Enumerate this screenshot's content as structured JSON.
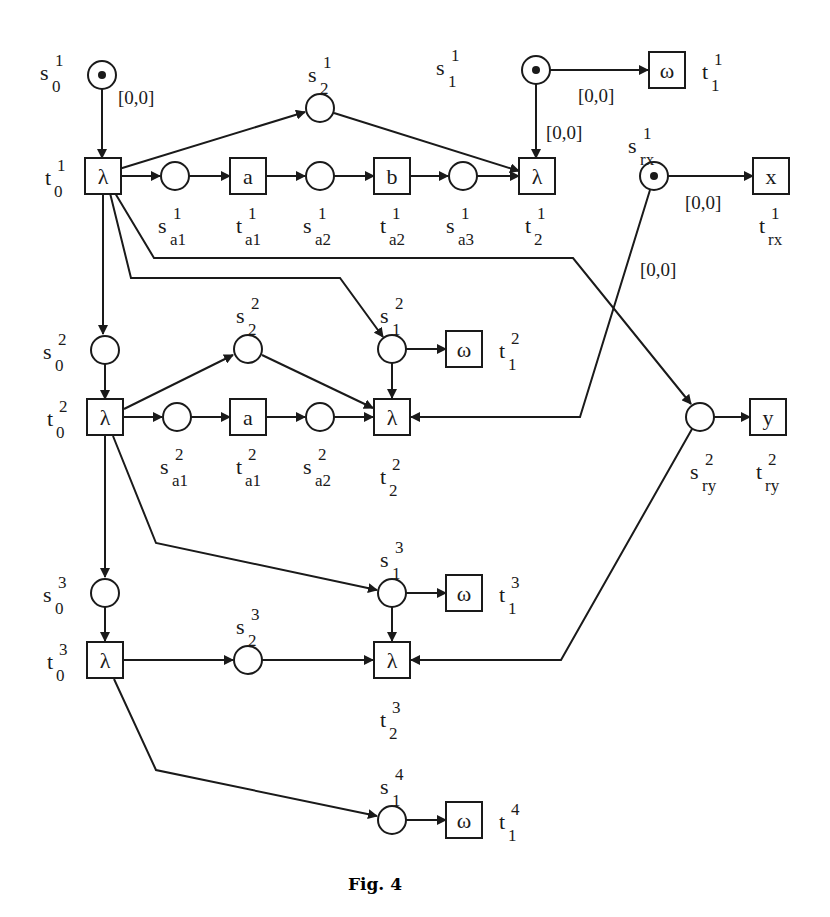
{
  "figure": {
    "caption": "Fig. 4",
    "type": "petri-net",
    "stroke_color": "#1a1a1a",
    "background": "#ffffff"
  },
  "places": [
    {
      "id": "s0_1",
      "base": "s",
      "sub": "0",
      "sup": "1",
      "x": 102,
      "y": 75,
      "token": true
    },
    {
      "id": "s2_1",
      "base": "s",
      "sub": "2",
      "sup": "1",
      "x": 320,
      "y": 108,
      "token": false
    },
    {
      "id": "sa1_1",
      "base": "s",
      "sub": "a1",
      "sup": "1",
      "x": 175,
      "y": 176,
      "token": false
    },
    {
      "id": "sa2_1",
      "base": "s",
      "sub": "a2",
      "sup": "1",
      "x": 320,
      "y": 176,
      "token": false
    },
    {
      "id": "sa3_1",
      "base": "s",
      "sub": "a3",
      "sup": "1",
      "x": 463,
      "y": 176,
      "token": false
    },
    {
      "id": "s1_1",
      "base": "s",
      "sub": "1",
      "sup": "1",
      "x": 536,
      "y": 70,
      "token": true
    },
    {
      "id": "srx_1",
      "base": "s",
      "sub": "rx",
      "sup": "1",
      "x": 654,
      "y": 176,
      "token": true
    },
    {
      "id": "s0_2",
      "base": "s",
      "sub": "0",
      "sup": "2",
      "x": 105,
      "y": 350,
      "token": false
    },
    {
      "id": "s2_2",
      "base": "s",
      "sub": "2",
      "sup": "2",
      "x": 248,
      "y": 349,
      "token": false
    },
    {
      "id": "s1_2",
      "base": "s",
      "sub": "1",
      "sup": "2",
      "x": 392,
      "y": 349,
      "token": false
    },
    {
      "id": "sa1_2",
      "base": "s",
      "sub": "a1",
      "sup": "2",
      "x": 177,
      "y": 417,
      "token": false
    },
    {
      "id": "sa2_2",
      "base": "s",
      "sub": "a2",
      "sup": "2",
      "x": 320,
      "y": 417,
      "token": false
    },
    {
      "id": "sry_2",
      "base": "s",
      "sub": "ry",
      "sup": "2",
      "x": 700,
      "y": 417,
      "token": false
    },
    {
      "id": "s0_3",
      "base": "s",
      "sub": "0",
      "sup": "3",
      "x": 105,
      "y": 593,
      "token": false
    },
    {
      "id": "s1_3",
      "base": "s",
      "sub": "1",
      "sup": "3",
      "x": 392,
      "y": 593,
      "token": false
    },
    {
      "id": "s2_3",
      "base": "s",
      "sub": "2",
      "sup": "3",
      "x": 248,
      "y": 660,
      "token": false
    },
    {
      "id": "s1_4",
      "base": "s",
      "sub": "1",
      "sup": "4",
      "x": 392,
      "y": 820,
      "token": false
    }
  ],
  "transitions": [
    {
      "id": "t0_1",
      "symbol": "λ",
      "base": "t",
      "sub": "0",
      "sup": "1",
      "x": 103,
      "y": 176
    },
    {
      "id": "ta1_1",
      "symbol": "a",
      "base": "t",
      "sub": "a1",
      "sup": "1",
      "x": 248,
      "y": 176
    },
    {
      "id": "ta2_1",
      "symbol": "b",
      "base": "t",
      "sub": "a2",
      "sup": "1",
      "x": 392,
      "y": 176
    },
    {
      "id": "t2_1",
      "symbol": "λ",
      "base": "t",
      "sub": "2",
      "sup": "1",
      "x": 537,
      "y": 176
    },
    {
      "id": "t1_1",
      "symbol": "ω",
      "base": "t",
      "sub": "1",
      "sup": "1",
      "x": 667,
      "y": 70
    },
    {
      "id": "trx_1",
      "symbol": "x",
      "base": "t",
      "sub": "rx",
      "sup": "1",
      "x": 771,
      "y": 176
    },
    {
      "id": "t0_2",
      "symbol": "λ",
      "base": "t",
      "sub": "0",
      "sup": "2",
      "x": 105,
      "y": 417
    },
    {
      "id": "ta1_2",
      "symbol": "a",
      "base": "t",
      "sub": "a1",
      "sup": "2",
      "x": 248,
      "y": 417
    },
    {
      "id": "t2_2",
      "symbol": "λ",
      "base": "t",
      "sub": "2",
      "sup": "2",
      "x": 392,
      "y": 417
    },
    {
      "id": "t1_2",
      "symbol": "ω",
      "base": "t",
      "sub": "1",
      "sup": "2",
      "x": 464,
      "y": 349
    },
    {
      "id": "try_2",
      "symbol": "y",
      "base": "t",
      "sub": "ry",
      "sup": "2",
      "x": 768,
      "y": 417
    },
    {
      "id": "t0_3",
      "symbol": "λ",
      "base": "t",
      "sub": "0",
      "sup": "3",
      "x": 105,
      "y": 660
    },
    {
      "id": "t2_3",
      "symbol": "λ",
      "base": "t",
      "sub": "2",
      "sup": "3",
      "x": 392,
      "y": 660
    },
    {
      "id": "t1_3",
      "symbol": "ω",
      "base": "t",
      "sub": "1",
      "sup": "3",
      "x": 464,
      "y": 593
    },
    {
      "id": "t1_4",
      "symbol": "ω",
      "base": "t",
      "sub": "1",
      "sup": "4",
      "x": 464,
      "y": 820
    }
  ],
  "intervals": [
    {
      "id": "iv_s0_1",
      "text": "[0,0]",
      "x": 118,
      "y": 104
    },
    {
      "id": "iv_s1_1_t1_1",
      "text": "[0,0]",
      "x": 578,
      "y": 102
    },
    {
      "id": "iv_s1_1_t2_1",
      "text": "[0,0]",
      "x": 546,
      "y": 139
    },
    {
      "id": "iv_srx_trx",
      "text": "[0,0]",
      "x": 685,
      "y": 209
    },
    {
      "id": "iv_srx_t2_2",
      "text": "[0,0]",
      "x": 640,
      "y": 276
    }
  ],
  "arcs": [
    {
      "from": "s0_1",
      "to": "t0_1",
      "points": [
        [
          102,
          89
        ],
        [
          102,
          158
        ]
      ]
    },
    {
      "from": "t0_1",
      "to": "s2_1",
      "points": [
        [
          119,
          169
        ],
        [
          305,
          112
        ]
      ]
    },
    {
      "from": "s2_1",
      "to": "t2_1",
      "points": [
        [
          334,
          113
        ],
        [
          519,
          171
        ]
      ]
    },
    {
      "from": "t0_1",
      "to": "sa1_1",
      "points": [
        [
          119,
          176
        ],
        [
          160,
          176
        ]
      ]
    },
    {
      "from": "sa1_1",
      "to": "ta1_1",
      "points": [
        [
          189,
          176
        ],
        [
          230,
          176
        ]
      ]
    },
    {
      "from": "ta1_1",
      "to": "sa2_1",
      "points": [
        [
          266,
          176
        ],
        [
          305,
          176
        ]
      ]
    },
    {
      "from": "sa2_1",
      "to": "ta2_1",
      "points": [
        [
          334,
          176
        ],
        [
          374,
          176
        ]
      ]
    },
    {
      "from": "ta2_1",
      "to": "sa3_1",
      "points": [
        [
          410,
          176
        ],
        [
          448,
          176
        ]
      ]
    },
    {
      "from": "sa3_1",
      "to": "t2_1",
      "points": [
        [
          477,
          176
        ],
        [
          519,
          176
        ]
      ]
    },
    {
      "from": "s1_1",
      "to": "t1_1",
      "points": [
        [
          550,
          70
        ],
        [
          648,
          70
        ]
      ]
    },
    {
      "from": "s1_1",
      "to": "t2_1",
      "points": [
        [
          536,
          84
        ],
        [
          536,
          158
        ]
      ]
    },
    {
      "from": "srx_1",
      "to": "trx_1",
      "points": [
        [
          668,
          176
        ],
        [
          753,
          176
        ]
      ]
    },
    {
      "from": "t0_1",
      "to": "sry_2",
      "points": [
        [
          115,
          193
        ],
        [
          154,
          258
        ],
        [
          573,
          258
        ],
        [
          691,
          404
        ]
      ]
    },
    {
      "from": "t0_1",
      "to": "s1_2",
      "points": [
        [
          110,
          193
        ],
        [
          131,
          278
        ],
        [
          340,
          278
        ],
        [
          383,
          337
        ]
      ]
    },
    {
      "from": "t0_1",
      "to": "s0_2",
      "points": [
        [
          103,
          193
        ],
        [
          103,
          334
        ]
      ]
    },
    {
      "from": "s0_2",
      "to": "t0_2",
      "points": [
        [
          105,
          364
        ],
        [
          105,
          399
        ]
      ]
    },
    {
      "from": "t0_2",
      "to": "s2_2",
      "points": [
        [
          124,
          409
        ],
        [
          233,
          355
        ]
      ]
    },
    {
      "from": "s2_2",
      "to": "t2_2",
      "points": [
        [
          262,
          355
        ],
        [
          373,
          408
        ]
      ]
    },
    {
      "from": "t0_2",
      "to": "sa1_2",
      "points": [
        [
          124,
          417
        ],
        [
          162,
          417
        ]
      ]
    },
    {
      "from": "sa1_2",
      "to": "ta1_2",
      "points": [
        [
          191,
          417
        ],
        [
          230,
          417
        ]
      ]
    },
    {
      "from": "ta1_2",
      "to": "sa2_2",
      "points": [
        [
          266,
          417
        ],
        [
          305,
          417
        ]
      ]
    },
    {
      "from": "sa2_2",
      "to": "t2_2",
      "points": [
        [
          334,
          417
        ],
        [
          373,
          417
        ]
      ]
    },
    {
      "from": "s1_2",
      "to": "t1_2",
      "points": [
        [
          406,
          349
        ],
        [
          446,
          349
        ]
      ]
    },
    {
      "from": "s1_2",
      "to": "t2_2",
      "points": [
        [
          392,
          363
        ],
        [
          392,
          398
        ]
      ]
    },
    {
      "from": "srx_1",
      "to": "t2_2",
      "points": [
        [
          650,
          190
        ],
        [
          580,
          417
        ],
        [
          411,
          417
        ]
      ]
    },
    {
      "from": "sry_2",
      "to": "try_2",
      "points": [
        [
          714,
          417
        ],
        [
          750,
          417
        ]
      ]
    },
    {
      "from": "t0_2",
      "to": "s0_3",
      "points": [
        [
          105,
          436
        ],
        [
          105,
          577
        ]
      ]
    },
    {
      "from": "t0_2",
      "to": "s1_3",
      "points": [
        [
          113,
          436
        ],
        [
          156,
          543
        ],
        [
          377,
          590
        ]
      ]
    },
    {
      "from": "s0_3",
      "to": "t0_3",
      "points": [
        [
          105,
          607
        ],
        [
          105,
          641
        ]
      ]
    },
    {
      "from": "t0_3",
      "to": "s2_3",
      "points": [
        [
          124,
          660
        ],
        [
          233,
          660
        ]
      ]
    },
    {
      "from": "s2_3",
      "to": "t2_3",
      "points": [
        [
          262,
          660
        ],
        [
          373,
          660
        ]
      ]
    },
    {
      "from": "s1_3",
      "to": "t1_3",
      "points": [
        [
          406,
          593
        ],
        [
          446,
          593
        ]
      ]
    },
    {
      "from": "s1_3",
      "to": "t2_3",
      "points": [
        [
          392,
          607
        ],
        [
          392,
          641
        ]
      ]
    },
    {
      "from": "sry_2",
      "to": "t2_3",
      "points": [
        [
          692,
          429
        ],
        [
          561,
          660
        ],
        [
          411,
          660
        ]
      ]
    },
    {
      "from": "t0_3",
      "to": "s1_4",
      "points": [
        [
          114,
          679
        ],
        [
          156,
          770
        ],
        [
          377,
          816
        ]
      ]
    },
    {
      "from": "s1_4",
      "to": "t1_4",
      "points": [
        [
          406,
          820
        ],
        [
          446,
          820
        ]
      ]
    }
  ]
}
